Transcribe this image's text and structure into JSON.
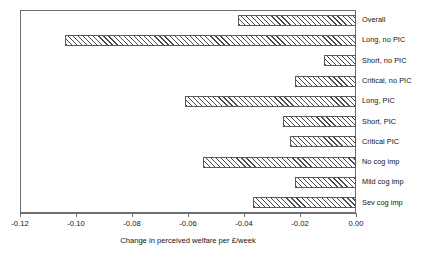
{
  "chart_data": {
    "type": "bar",
    "orientation": "horizontal",
    "title": "",
    "xlabel": "Change in perceived welfare per £/week",
    "ylabel": "",
    "xlim": [
      -0.12,
      0.0
    ],
    "grid": false,
    "legend": null,
    "xticks": [
      -0.12,
      -0.1,
      -0.08,
      -0.06,
      -0.04,
      -0.02,
      0.0
    ],
    "xticklabels": [
      "-0.12",
      "-0.10",
      "-0.08",
      "-0.06",
      "-0.04",
      "-0.02",
      "0.00"
    ],
    "categories": [
      "Overall",
      "Long, no PIC",
      "Short, no PIC",
      "Critical, no PIC",
      "Long, PIC",
      "Short, PIC",
      "Critical PIC",
      "No cog imp",
      "Mild cog imp",
      "Sev cog imp"
    ],
    "values": [
      -0.042,
      -0.104,
      -0.0114,
      -0.0218,
      -0.061,
      -0.026,
      -0.0236,
      -0.0546,
      -0.0218,
      -0.0368
    ],
    "bar_style": {
      "fill": "hatched-diagonal",
      "edge_color": "#5a5a5a",
      "face_color": "#ffffff"
    }
  },
  "axis": {
    "frame_color": "#6f6f6f"
  }
}
